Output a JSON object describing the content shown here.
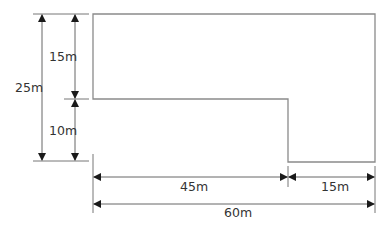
{
  "diagram": {
    "title": "",
    "dimensions": {
      "total_height": "25m",
      "upper_height": "15m",
      "lower_height": "10m",
      "left_width": "45m",
      "right_width": "15m",
      "total_width": "60m"
    },
    "colors": {
      "outline": "#8a8a8a",
      "dimension": "#555555",
      "arrow": "#1a1a1a",
      "text": "#333333"
    }
  }
}
